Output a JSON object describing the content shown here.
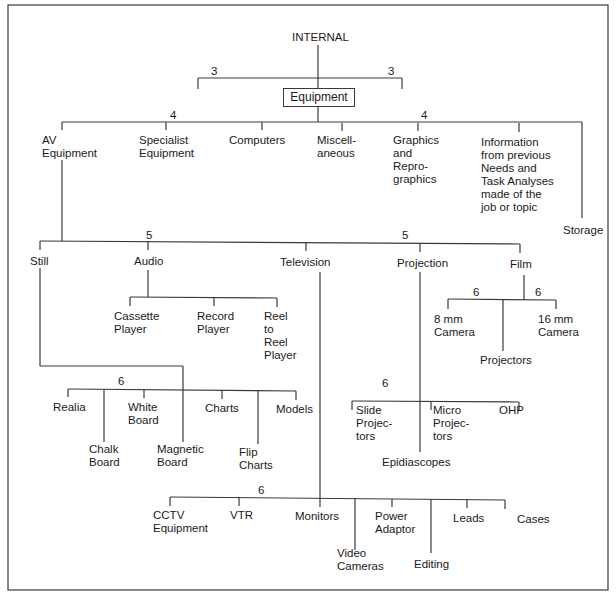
{
  "diagram": {
    "root": "INTERNAL",
    "root_branch_numbers": [
      "3",
      "3"
    ],
    "equipment_label": "Equipment",
    "level4": {
      "numbers": [
        "4",
        "4"
      ],
      "items": [
        "AV\nEquipment",
        "Specialist\nEquipment",
        "Computers",
        "Miscell-\naneous",
        "Graphics\nand\nRepro-\ngraphics",
        "Information\nfrom previous\nNeeds and\nTask Analyses\nmade of the\njob or topic",
        "Storage"
      ]
    },
    "level5": {
      "numbers": [
        "5",
        "5"
      ],
      "items": [
        "Still",
        "Audio",
        "Television",
        "Projection",
        "Film"
      ]
    },
    "audio_children": [
      "Cassette\nPlayer",
      "Record\nPlayer",
      "Reel\nto\nReel\nPlayer"
    ],
    "film": {
      "numbers": [
        "6",
        "6"
      ],
      "children": [
        "8 mm\nCamera",
        "Projectors",
        "16 mm\nCamera"
      ]
    },
    "still": {
      "number": "6",
      "children": [
        "Realia",
        "Chalk\nBoard",
        "White\nBoard",
        "Magnetic\nBoard",
        "Charts",
        "Flip\nCharts",
        "Models"
      ]
    },
    "projection": {
      "number": "6",
      "children": [
        "Slide\nProjec-\ntors",
        "Epidiascopes",
        "Micro\nProjec-\ntors",
        "OHP"
      ]
    },
    "television": {
      "number": "6",
      "children": [
        "CCTV\nEquipment",
        "VTR",
        "Monitors",
        "Video\nCameras",
        "Power\nAdaptor",
        "Editing",
        "Leads",
        "Cases"
      ]
    }
  }
}
